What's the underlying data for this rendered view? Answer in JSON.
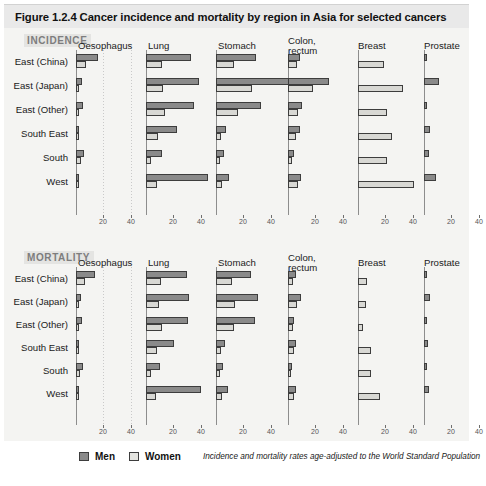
{
  "figure": {
    "title": "Figure 1.2.4  Cancer incidence and mortality by region in Asia for selected cancers"
  },
  "legend": {
    "men_label": "Men",
    "women_label": "Women",
    "note": "Incidence and mortality rates age-adjusted to the World Standard Population"
  },
  "panels": {
    "incidence_label": "INCIDENCE",
    "mortality_label": "MORTALITY"
  },
  "axis": {
    "ticks": [
      20,
      40
    ],
    "tick_labels": [
      "20",
      "40"
    ],
    "xmin": 0,
    "xmax": 48
  },
  "colors": {
    "men": "#8a8a8a",
    "women": "#d8d8d4",
    "bar_outline": "#3d3d3d",
    "panel_background": "#f4f4f2",
    "title_background": "#e9e9e9",
    "panel_label": "#7d7d7d"
  },
  "chart_data": {
    "type": "bar",
    "title": "Cancer incidence and mortality by region in Asia for selected cancers",
    "xlabel": "",
    "ylabel": "",
    "xlim": [
      0,
      48
    ],
    "grid": true,
    "legend_position": "bottom-left",
    "orientation": "horizontal",
    "categories": [
      "East (China)",
      "East (Japan)",
      "East (Other)",
      "South East",
      "South",
      "West"
    ],
    "cancer_sites": [
      "Oesophagus",
      "Lung",
      "Stomach",
      "Colon,\nrectum",
      "Breast",
      "Prostate"
    ],
    "panels": [
      {
        "name": "INCIDENCE",
        "series": [
          {
            "site": "Oesophagus",
            "men": [
              15.8,
              4.6,
              4.8,
              2.2,
              6.2,
              1.6
            ],
            "women": [
              7.3,
              1.2,
              1.4,
              1.0,
              3.6,
              0.9
            ]
          },
          {
            "site": "Lung",
            "men": [
              32.5,
              38.8,
              35.3,
              22.8,
              11.8,
              45.2
            ],
            "women": [
              11.5,
              12.3,
              14.2,
              8.6,
              3.8,
              8.2
            ]
          },
          {
            "site": "Stomach",
            "men": [
              29.4,
              62.0,
              32.5,
              7.2,
              5.8,
              9.5
            ],
            "women": [
              13.4,
              26.0,
              16.0,
              3.7,
              3.0,
              4.5
            ]
          },
          {
            "site": "Colon, rectum",
            "men": [
              8.5,
              30.0,
              10.5,
              8.4,
              4.2,
              9.6
            ],
            "women": [
              6.3,
              18.5,
              7.6,
              6.0,
              2.8,
              7.2
            ]
          },
          {
            "site": "Breast",
            "men": [
              0,
              0,
              0,
              0,
              0,
              0
            ],
            "women": [
              18.7,
              32.5,
              21.0,
              24.8,
              21.4,
              41.0
            ]
          },
          {
            "site": "Prostate",
            "men": [
              1.5,
              11.0,
              2.2,
              4.5,
              3.6,
              8.8
            ],
            "women": [
              0,
              0,
              0,
              0,
              0,
              0
            ]
          }
        ]
      },
      {
        "name": "MORTALITY",
        "series": [
          {
            "site": "Oesophagus",
            "men": [
              14.0,
              4.0,
              4.2,
              2.0,
              5.2,
              1.8
            ],
            "women": [
              6.6,
              1.1,
              1.3,
              1.0,
              3.2,
              1.0
            ]
          },
          {
            "site": "Lung",
            "men": [
              29.8,
              31.5,
              30.5,
              20.6,
              10.3,
              39.8
            ],
            "women": [
              10.6,
              9.8,
              12.0,
              7.8,
              3.4,
              7.4
            ]
          },
          {
            "site": "Stomach",
            "men": [
              25.6,
              30.5,
              28.3,
              6.4,
              5.4,
              8.6
            ],
            "women": [
              11.6,
              14.0,
              13.2,
              3.4,
              2.8,
              4.2
            ]
          },
          {
            "site": "Colon, rectum",
            "men": [
              5.6,
              9.8,
              4.2,
              5.8,
              2.6,
              5.6
            ],
            "women": [
              4.0,
              6.5,
              3.4,
              4.2,
              2.0,
              4.4
            ]
          },
          {
            "site": "Breast",
            "men": [
              0,
              0,
              0,
              0,
              0,
              0
            ],
            "women": [
              6.4,
              5.8,
              4.0,
              9.2,
              9.8,
              16.0
            ]
          },
          {
            "site": "Prostate",
            "men": [
              0.8,
              4.6,
              1.0,
              3.2,
              2.4,
              3.4
            ],
            "women": [
              0,
              0,
              0,
              0,
              0,
              0
            ]
          }
        ]
      }
    ]
  }
}
